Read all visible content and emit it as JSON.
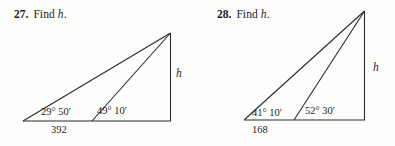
{
  "page": {
    "background": "#fdfdfc",
    "ink": "#1c1c1c"
  },
  "problems": [
    {
      "number": "27.",
      "instruction": "Find",
      "unknown": "h",
      "period": ".",
      "figure": {
        "base_label": "392",
        "height_label": "h",
        "angle_left": "29° 50′",
        "angle_right": "49° 10′"
      }
    },
    {
      "number": "28.",
      "instruction": "Find",
      "unknown": "h",
      "period": ".",
      "figure": {
        "base_label": "168",
        "height_label": "h",
        "angle_left": "41° 10′",
        "angle_right": "52° 30′"
      }
    }
  ]
}
